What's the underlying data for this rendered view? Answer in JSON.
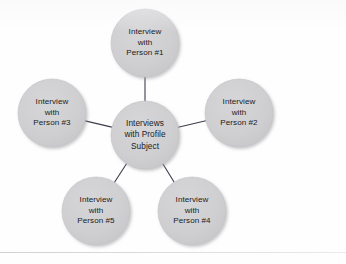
{
  "diagram": {
    "type": "hub-and-spoke",
    "title_visible": false,
    "background_color": "#fefefe",
    "node_fill": "#cfcfd1",
    "node_stroke": "#c3c3c6",
    "connector_color": "#3d3d4a",
    "text_color": "#1b1b22",
    "hub": {
      "id": "hub",
      "name": "interviews-with-profile-subject",
      "cx": 145,
      "cy": 135,
      "r": 34,
      "lines": [
        "Interviews",
        "with Profile",
        "Subject"
      ]
    },
    "spokes": [
      {
        "id": "person-1",
        "name": "interview-with-person-1",
        "cx": 145,
        "cy": 43,
        "r": 34,
        "position": "top",
        "lines": [
          "Interview",
          "with",
          "Person #1"
        ]
      },
      {
        "id": "person-2",
        "name": "interview-with-person-2",
        "cx": 239,
        "cy": 113,
        "r": 34,
        "position": "right",
        "lines": [
          "Interview",
          "with",
          "Person #2"
        ]
      },
      {
        "id": "person-3",
        "name": "interview-with-person-3",
        "cx": 52,
        "cy": 113,
        "r": 34,
        "position": "left",
        "lines": [
          "Interview",
          "with",
          "Person #3"
        ]
      },
      {
        "id": "person-4",
        "name": "interview-with-person-4",
        "cx": 192,
        "cy": 211,
        "r": 34,
        "position": "bottom-right",
        "lines": [
          "Interview",
          "with",
          "Person #4"
        ]
      },
      {
        "id": "person-5",
        "name": "interview-with-person-5",
        "cx": 96,
        "cy": 211,
        "r": 34,
        "position": "bottom-left",
        "lines": [
          "Interview",
          "with",
          "Person #5"
        ]
      }
    ],
    "connectors": [
      {
        "from": "hub",
        "to": "person-1"
      },
      {
        "from": "hub",
        "to": "person-2"
      },
      {
        "from": "hub",
        "to": "person-3"
      },
      {
        "from": "hub",
        "to": "person-4"
      },
      {
        "from": "hub",
        "to": "person-5"
      }
    ]
  }
}
